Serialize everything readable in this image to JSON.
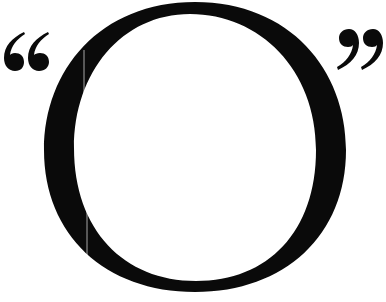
{
  "graphic": {
    "text": "“O”",
    "letter": "O",
    "open_quote": "“",
    "close_quote": "”",
    "ink_color": "#0a0a0a",
    "background_color": "#ffffff"
  }
}
